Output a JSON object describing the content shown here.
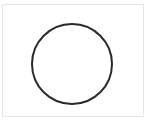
{
  "diagram": {
    "shape": "circle",
    "stroke_color": "#2a2a2a",
    "fill_color": "none",
    "frame_border_color": "#e6e6e6",
    "background_color": "#ffffff"
  }
}
